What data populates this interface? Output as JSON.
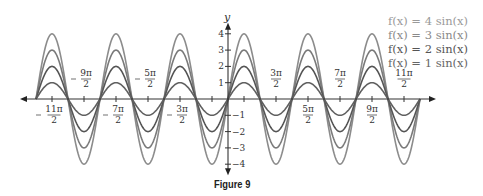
{
  "chart_data": {
    "type": "line",
    "title": "",
    "caption": "Figure 9",
    "xlabel": "",
    "ylabel": "y",
    "xlim_pi_halves": [
      -13,
      13
    ],
    "curve_domain_pi_halves": [
      -12,
      12
    ],
    "ylim": [
      -4.5,
      4.5
    ],
    "grid": false,
    "legend_position": "top-right",
    "x_ticks": [
      {
        "k": -11,
        "num": "11π",
        "den": "2",
        "neg": true,
        "pos": "below"
      },
      {
        "k": -9,
        "num": "9π",
        "den": "2",
        "neg": true,
        "pos": "above"
      },
      {
        "k": -7,
        "num": "7π",
        "den": "2",
        "neg": true,
        "pos": "below"
      },
      {
        "k": -5,
        "num": "5π",
        "den": "2",
        "neg": true,
        "pos": "above"
      },
      {
        "k": -3,
        "num": "3π",
        "den": "2",
        "neg": true,
        "pos": "below"
      },
      {
        "k": -1,
        "num": "",
        "den": "",
        "neg": true,
        "pos": "none"
      },
      {
        "k": 1,
        "num": "",
        "den": "",
        "neg": false,
        "pos": "none"
      },
      {
        "k": 3,
        "num": "3π",
        "den": "2",
        "neg": false,
        "pos": "above"
      },
      {
        "k": 5,
        "num": "5π",
        "den": "2",
        "neg": false,
        "pos": "below"
      },
      {
        "k": 7,
        "num": "7π",
        "den": "2",
        "neg": false,
        "pos": "above"
      },
      {
        "k": 9,
        "num": "9π",
        "den": "2",
        "neg": false,
        "pos": "below"
      },
      {
        "k": 11,
        "num": "11π",
        "den": "2",
        "neg": false,
        "pos": "above"
      }
    ],
    "y_ticks": [
      {
        "v": 4,
        "label": "4"
      },
      {
        "v": 3,
        "label": "3"
      },
      {
        "v": 2,
        "label": "2"
      },
      {
        "v": 1,
        "label": "1"
      },
      {
        "v": -1,
        "label": "−1"
      },
      {
        "v": -2,
        "label": "−2"
      },
      {
        "v": -3,
        "label": "−3"
      },
      {
        "v": -4,
        "label": "−4"
      }
    ],
    "series": [
      {
        "name": "f(x) = 4 sin(x)",
        "amplitude": 4,
        "color": "#8c8c8c",
        "legend_color": "#9a9a9a"
      },
      {
        "name": "f(x) = 3 sin(x)",
        "amplitude": 3,
        "color": "#7a7a7a",
        "legend_color": "#8a8a8a"
      },
      {
        "name": "f(x) = 2 sin(x)",
        "amplitude": 2,
        "color": "#555555",
        "legend_color": "#555555"
      },
      {
        "name": "f(x) = 1 sin(x)",
        "amplitude": 1,
        "color": "#606060",
        "legend_color": "#666666"
      }
    ]
  }
}
